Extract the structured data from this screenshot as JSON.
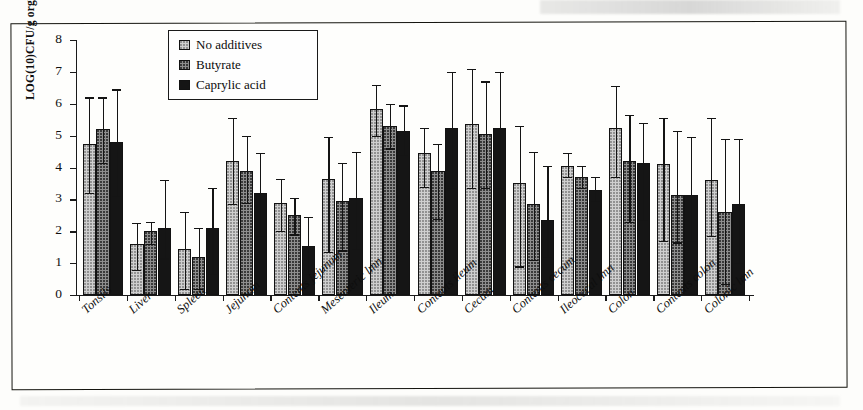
{
  "chart_data": {
    "type": "bar",
    "title": "",
    "subtitle": "",
    "xlabel": "",
    "ylabel": "LOG(10)CFU/g organ",
    "ylim": [
      0,
      8
    ],
    "ytick_values": [
      0,
      1,
      2,
      3,
      4,
      5,
      6,
      7,
      8
    ],
    "ytick_labels": [
      "0",
      "1",
      "2",
      "3",
      "4",
      "5",
      "6",
      "7",
      "8"
    ],
    "grid": false,
    "legend_position": "top-left-inside",
    "categories": [
      "Tonsils",
      "Liver",
      "Spleen",
      "Jejunum",
      "Contents jejunum",
      "Mesenteric lmn",
      "Ileum",
      "Contents ileum",
      "Cecum",
      "Contents cecum",
      "Ileocecal lmn",
      "Colon",
      "Contents colon",
      "Colonic lmn"
    ],
    "series": [
      {
        "name": "No additives",
        "pattern": "light-dotted",
        "color": "#cfcfcf",
        "values": [
          4.75,
          1.6,
          1.45,
          4.2,
          2.9,
          3.65,
          5.85,
          4.45,
          5.35,
          3.5,
          4.05,
          5.25,
          4.1,
          3.6
        ],
        "err_low": [
          1.55,
          0.8,
          1.25,
          1.35,
          0.9,
          2.3,
          0.85,
          1.05,
          2.0,
          2.6,
          0.35,
          1.55,
          2.4,
          1.75
        ],
        "err_high": [
          1.45,
          0.65,
          1.15,
          1.35,
          0.75,
          1.3,
          0.75,
          0.8,
          1.75,
          1.8,
          0.4,
          1.3,
          1.45,
          1.95
        ]
      },
      {
        "name": "Butyrate",
        "pattern": "medium-dotted",
        "color": "#8e8e8e",
        "values": [
          5.2,
          2.0,
          1.2,
          3.9,
          2.5,
          2.95,
          5.3,
          3.9,
          5.05,
          2.85,
          3.7,
          4.2,
          3.15,
          2.6
        ],
        "err_low": [
          1.05,
          0.4,
          1.0,
          1.0,
          0.6,
          1.55,
          0.7,
          1.5,
          1.7,
          1.75,
          0.35,
          1.9,
          1.5,
          2.25
        ],
        "err_high": [
          1.0,
          0.3,
          0.9,
          1.1,
          0.55,
          1.2,
          0.7,
          0.85,
          1.65,
          1.65,
          0.35,
          1.45,
          2.0,
          2.3
        ]
      },
      {
        "name": "Caprylic acid",
        "pattern": "solid-black",
        "color": "#151515",
        "values": [
          4.8,
          2.1,
          2.1,
          3.2,
          1.55,
          3.05,
          5.15,
          5.25,
          5.25,
          2.35,
          3.3,
          4.15,
          3.15,
          2.85
        ],
        "err_low": [
          1.7,
          0.95,
          1.45,
          1.35,
          0.9,
          1.6,
          0.75,
          1.9,
          1.9,
          1.15,
          0.35,
          1.8,
          1.45,
          1.85
        ],
        "err_high": [
          1.65,
          1.5,
          1.25,
          1.25,
          0.9,
          1.45,
          0.8,
          1.75,
          1.75,
          1.7,
          0.4,
          1.25,
          1.8,
          2.05
        ]
      }
    ]
  },
  "legend": {
    "items": [
      {
        "label": "No additives"
      },
      {
        "label": "Butyrate"
      },
      {
        "label": "Caprylic acid"
      }
    ]
  }
}
